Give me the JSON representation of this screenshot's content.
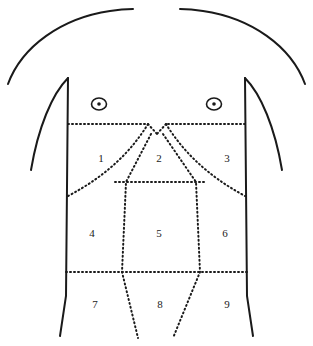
{
  "diagram": {
    "type": "anatomical-line-diagram",
    "colors": {
      "background": "#ffffff",
      "stroke": "#1a1a1a",
      "label": "#1a1a1a"
    },
    "regions": [
      {
        "number": "1",
        "x": 101,
        "y": 159
      },
      {
        "number": "2",
        "x": 159,
        "y": 159
      },
      {
        "number": "3",
        "x": 227,
        "y": 159
      },
      {
        "number": "4",
        "x": 92,
        "y": 234
      },
      {
        "number": "5",
        "x": 159,
        "y": 234
      },
      {
        "number": "6",
        "x": 225,
        "y": 234
      },
      {
        "number": "7",
        "x": 95,
        "y": 305
      },
      {
        "number": "8",
        "x": 160,
        "y": 305
      },
      {
        "number": "9",
        "x": 227,
        "y": 305
      }
    ],
    "markers": [
      {
        "name": "nipple-left",
        "cx": 99,
        "cy": 104,
        "rx": 7.5,
        "ry": 6,
        "dot_r": 1.8
      },
      {
        "name": "nipple-right",
        "cx": 214,
        "cy": 104,
        "rx": 7.5,
        "ry": 6,
        "dot_r": 1.8
      }
    ],
    "outline_paths": {
      "shoulder_left": "M 8 84 C 22 46 62 18 110 11 C 122 9 128 9 133 9",
      "shoulder_right": "M 305 84 C 291 46 251 18 203 11 C 191 9 185 9 180 9",
      "torso_left": "M 68 78 L 66 296 L 60 336",
      "torso_right": "M 245 78 L 247 296 L 253 336",
      "arm_left": "M 68 78 C 52 94 38 128 31 170",
      "arm_right": "M 245 78 C 261 94 275 128 282 170"
    },
    "plane_paths": {
      "transpyloric_left": "M 68 124 L 148 124",
      "transpyloric_right": "M 245 124 L 166 124",
      "costal_notch_left": "M 148 124 L 157 134",
      "costal_notch_right": "M 166 124 L 157 134",
      "costal_margin_left": "M 148 124 C 132 150 108 175 68 196",
      "costal_margin_right": "M 166 124 C 182 150 206 175 245 196",
      "subcostal_plane": "M 115 182 L 205 182",
      "intertubercular_plane": "M 66 272 L 247 272",
      "midclavicular_left": "M 151 134 L 126 182 L 122 272 L 138 338",
      "midclavicular_right": "M 163 134 L 196 182 L 200 272 L 173 338"
    }
  }
}
